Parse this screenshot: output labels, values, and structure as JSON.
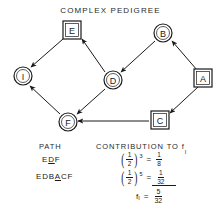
{
  "title": "COMPLEX PEDIGREE",
  "pedigree": {
    "nodes": [
      {
        "id": "E",
        "label": "E",
        "shape": "square",
        "x": 72,
        "y": 30
      },
      {
        "id": "B",
        "label": "B",
        "shape": "circle",
        "x": 163,
        "y": 33
      },
      {
        "id": "I",
        "label": "I",
        "shape": "circle",
        "x": 23,
        "y": 76
      },
      {
        "id": "D",
        "label": "D",
        "shape": "circle",
        "x": 113,
        "y": 80
      },
      {
        "id": "A",
        "label": "A",
        "shape": "square",
        "x": 203,
        "y": 78
      },
      {
        "id": "F",
        "label": "F",
        "shape": "circle",
        "x": 68,
        "y": 122
      },
      {
        "id": "C",
        "label": "C",
        "shape": "square",
        "x": 160,
        "y": 120
      }
    ],
    "edges": [
      {
        "from": "E",
        "to": "I"
      },
      {
        "from": "D",
        "to": "E"
      },
      {
        "from": "B",
        "to": "D"
      },
      {
        "from": "A",
        "to": "B"
      },
      {
        "from": "A",
        "to": "C"
      },
      {
        "from": "D",
        "to": "F"
      },
      {
        "from": "C",
        "to": "F"
      },
      {
        "from": "F",
        "to": "I"
      }
    ]
  },
  "legend": {
    "path_header": "PATH",
    "contribution_header": "CONTRIBUTION TO f",
    "contribution_header_sub": "I",
    "rows": [
      {
        "path_pre": "E",
        "path_underlined": "D",
        "path_post": "F",
        "base_num": "1",
        "base_den": "2",
        "exponent": "3",
        "result_num": "1",
        "result_den": "8"
      },
      {
        "path_pre": "EDB",
        "path_underlined": "A",
        "path_post": "CF",
        "base_num": "1",
        "base_den": "2",
        "exponent": "5",
        "result_num": "1",
        "result_den": "32"
      }
    ],
    "total": {
      "symbol": "f",
      "symbol_sub": "I",
      "equals": "=",
      "num": "5",
      "den": "32"
    },
    "equals": "="
  },
  "colors": {
    "ink": "#1a1a1a",
    "background": "#ffffff"
  }
}
